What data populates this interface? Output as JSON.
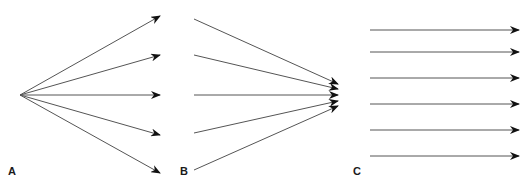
{
  "panels": [
    {
      "label": "A",
      "label_pos": [
        8,
        165
      ],
      "description": "diverging rays from a single point",
      "arrows": [
        {
          "x1": 20,
          "y1": 95,
          "x2": 160,
          "y2": 16
        },
        {
          "x1": 20,
          "y1": 95,
          "x2": 160,
          "y2": 55
        },
        {
          "x1": 20,
          "y1": 95,
          "x2": 160,
          "y2": 95
        },
        {
          "x1": 20,
          "y1": 95,
          "x2": 160,
          "y2": 135
        },
        {
          "x1": 20,
          "y1": 95,
          "x2": 160,
          "y2": 173
        }
      ]
    },
    {
      "label": "B",
      "label_pos": [
        180,
        165
      ],
      "description": "converging rays to a single point",
      "arrows": [
        {
          "x1": 194,
          "y1": 19,
          "x2": 338,
          "y2": 84
        },
        {
          "x1": 194,
          "y1": 55,
          "x2": 338,
          "y2": 89
        },
        {
          "x1": 194,
          "y1": 95,
          "x2": 338,
          "y2": 95
        },
        {
          "x1": 194,
          "y1": 133,
          "x2": 338,
          "y2": 101
        },
        {
          "x1": 194,
          "y1": 170,
          "x2": 338,
          "y2": 106
        }
      ]
    },
    {
      "label": "C",
      "label_pos": [
        353,
        165
      ],
      "description": "parallel rays",
      "arrows": [
        {
          "x1": 370,
          "y1": 30,
          "x2": 519,
          "y2": 30
        },
        {
          "x1": 370,
          "y1": 52,
          "x2": 519,
          "y2": 52
        },
        {
          "x1": 370,
          "y1": 78,
          "x2": 519,
          "y2": 78
        },
        {
          "x1": 370,
          "y1": 104,
          "x2": 519,
          "y2": 104
        },
        {
          "x1": 370,
          "y1": 130,
          "x2": 519,
          "y2": 130
        },
        {
          "x1": 370,
          "y1": 156,
          "x2": 519,
          "y2": 156
        }
      ]
    }
  ],
  "colors": {
    "line": "#555555",
    "arrowhead": "#111111",
    "label": "#1a1a1a",
    "background": "#ffffff"
  }
}
